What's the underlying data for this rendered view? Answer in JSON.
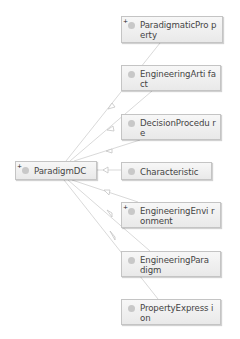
{
  "diagram": {
    "source_node": {
      "label": "ParadigmDC",
      "expandable": true,
      "expand_glyph": "+"
    },
    "target_nodes": [
      {
        "label": "ParadigmaticProperty",
        "display": "ParadigmaticPro perty",
        "expandable": true,
        "expand_glyph": "+"
      },
      {
        "label": "EngineeringArtifact",
        "display": "EngineeringArti fact",
        "expandable": false
      },
      {
        "label": "DecisionProcedure",
        "display": "DecisionProcedu re",
        "expandable": false
      },
      {
        "label": "Characteristic",
        "display": "Characteristic",
        "expandable": false
      },
      {
        "label": "EngineeringEnvironment",
        "display": "EngineeringEnvi ronment",
        "expandable": true,
        "expand_glyph": "+"
      },
      {
        "label": "EngineeringParadigm",
        "display": "EngineeringPara digm",
        "expandable": false
      },
      {
        "label": "PropertyExpression",
        "display": "PropertyExpress ion",
        "expandable": false
      }
    ],
    "edge_style": {
      "color": "#d0d0d0",
      "arrow": "hollow-triangle"
    }
  }
}
